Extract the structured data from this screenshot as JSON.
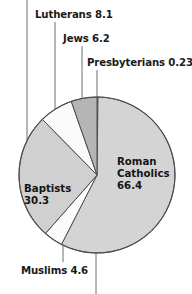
{
  "chart_data": {
    "type": "pie",
    "title": "",
    "subtitle": "",
    "xlabel": "",
    "ylabel": "",
    "legend_position": "none",
    "grid": false,
    "units": "millions",
    "categories": [
      "Presbyterians",
      "Roman Catholics",
      "Muslims",
      "Baptists",
      "Lutherans",
      "Jews"
    ],
    "values": [
      0.23,
      66.4,
      4.6,
      30.3,
      8.1,
      6.2
    ],
    "slices": [
      {
        "label": "Presbyterians",
        "value": 0.23,
        "value_text": "0.23",
        "color": "#a9a9a9",
        "label_text": "Presbyterians 0.23",
        "label_placement": "outside-leader"
      },
      {
        "label": "Roman Catholics",
        "value": 66.4,
        "value_text": "66.4",
        "color": "#d4d4d4",
        "label_text": "Roman Catholics 66.4",
        "label_placement": "inside"
      },
      {
        "label": "Muslims",
        "value": 4.6,
        "value_text": "4.6",
        "color": "#fbfbfb",
        "label_text": "Muslims 4.6",
        "label_placement": "outside-leader"
      },
      {
        "label": "Baptists",
        "value": 30.3,
        "value_text": "30.3",
        "color": "#d0d0d0",
        "label_text": "Baptists 30.3",
        "label_placement": "inside"
      },
      {
        "label": "Lutherans",
        "value": 8.1,
        "value_text": "8.1",
        "color": "#fafafa",
        "label_text": "Lutherans 8.1",
        "label_placement": "outside-leader"
      },
      {
        "label": "Jews",
        "value": 6.2,
        "value_text": "6.2",
        "color": "#b5b5b5",
        "label_text": "Jews 6.2",
        "label_placement": "outside-leader"
      }
    ]
  },
  "labels": {
    "lutherans": "Lutherans 8.1",
    "jews": "Jews 6.2",
    "presbyterians": "Presbyterians 0.23",
    "muslims": "Muslims 4.6",
    "baptists_name": "Baptists",
    "baptists_value": "30.3",
    "roman_line1": "Roman",
    "roman_line2": "Catholics",
    "roman_value": "66.4"
  },
  "colors": {
    "outline": "#4d4d4d",
    "leader": "#6f6f6f",
    "text": "#1a1a1a",
    "background": "#ffffff",
    "slice_light": "#d4d4d4",
    "slice_white": "#fbfbfb",
    "slice_mid": "#b5b5b5",
    "slice_dark": "#a9a9a9"
  },
  "geometry": {
    "center_x": 97,
    "center_y": 175,
    "radius": 78
  }
}
